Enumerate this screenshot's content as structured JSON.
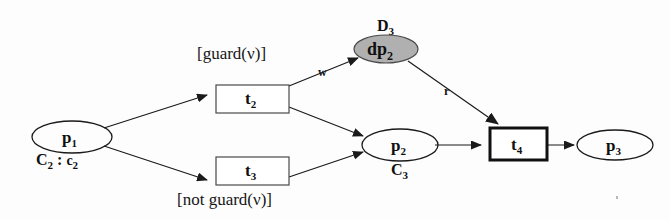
{
  "diagram": {
    "background_color": "#fdfdfd",
    "stroke_color": "#1a1a1a",
    "shaded_fill": "#b0b0b0",
    "places": [
      {
        "id": "p1",
        "label": "p",
        "sub": "1",
        "tag": "C",
        "tag_sub": "2",
        "tag_value": "c",
        "tag_value_sub": "2"
      },
      {
        "id": "p2",
        "label": "p",
        "sub": "2",
        "tag": "C",
        "tag_sub": "3"
      },
      {
        "id": "p3",
        "label": "p",
        "sub": "3"
      },
      {
        "id": "dp2",
        "label": "dp",
        "sub": "2",
        "tag": "D",
        "tag_sub": "3",
        "shaded": true
      }
    ],
    "transitions": [
      {
        "id": "t2",
        "label": "t",
        "sub": "2",
        "guard": "[guard(ν)]",
        "bold_border": false
      },
      {
        "id": "t3",
        "label": "t",
        "sub": "3",
        "guard": "[not guard(ν)]",
        "bold_border": false
      },
      {
        "id": "t4",
        "label": "t",
        "sub": "4",
        "bold_border": true
      }
    ],
    "arcs": [
      {
        "from": "p1",
        "to": "t2",
        "label": ""
      },
      {
        "from": "p1",
        "to": "t3",
        "label": ""
      },
      {
        "from": "t2",
        "to": "dp2",
        "label": "w"
      },
      {
        "from": "t2",
        "to": "p2",
        "label": ""
      },
      {
        "from": "t3",
        "to": "p2",
        "label": ""
      },
      {
        "from": "dp2",
        "to": "t4",
        "label": "r"
      },
      {
        "from": "p2",
        "to": "t4",
        "label": ""
      },
      {
        "from": "t4",
        "to": "p3",
        "label": ""
      }
    ],
    "guard_true_text": "[guard(ν)]",
    "guard_false_text": "[not guard(ν)]",
    "arc_label_w": "w",
    "arc_label_r": "r"
  }
}
